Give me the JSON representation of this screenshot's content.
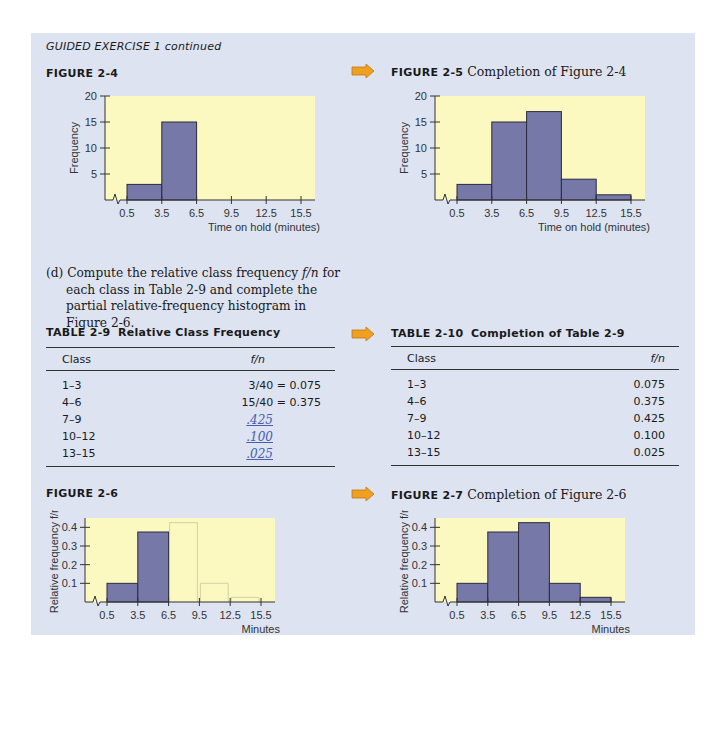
{
  "section_header": "GUIDED EXERCISE 1 continued",
  "figures": {
    "fig_2_4": {
      "label": "FIGURE 2-4",
      "title": ""
    },
    "fig_2_5": {
      "label": "FIGURE 2-5",
      "title": "Completion of Figure 2-4"
    },
    "fig_2_6": {
      "label": "FIGURE 2-6",
      "title": ""
    },
    "fig_2_7": {
      "label": "FIGURE 2-7",
      "title": "Completion of Figure 2-6"
    }
  },
  "paragraph": {
    "prefix": "(d) Compute the relative class frequency ",
    "italic": "f/n",
    "suffix": " for each class in Table 2-9 and complete the partial relative-frequency histogram in Figure 2-6."
  },
  "table_2_9": {
    "label": "TABLE 2-9",
    "title": "Relative Class Frequency",
    "columns": [
      "Class",
      "f/n"
    ],
    "rows": [
      {
        "class": "1–3",
        "value": "3/40 = 0.075",
        "handwritten": false
      },
      {
        "class": "4–6",
        "value": "15/40 = 0.375",
        "handwritten": false
      },
      {
        "class": "7–9",
        "value": ".425",
        "handwritten": true
      },
      {
        "class": "10–12",
        "value": ".100",
        "handwritten": true
      },
      {
        "class": "13–15",
        "value": ".025",
        "handwritten": true
      }
    ]
  },
  "table_2_10": {
    "label": "TABLE 2-10",
    "title": "Completion of Table 2-9",
    "columns": [
      "Class",
      "f/n"
    ],
    "rows": [
      {
        "class": "1–3",
        "value": "0.075"
      },
      {
        "class": "4–6",
        "value": "0.375"
      },
      {
        "class": "7–9",
        "value": "0.425"
      },
      {
        "class": "10–12",
        "value": "0.100"
      },
      {
        "class": "13–15",
        "value": "0.025"
      }
    ]
  },
  "colors": {
    "panel_bg": "#dde3f1",
    "plot_bg": "#fbf8c0",
    "bar_fill": "#7678a8",
    "bar_stroke": "#2a2a40",
    "arrow": "#f0a020"
  },
  "chart_data": [
    {
      "id": "figure-2-4",
      "type": "bar",
      "title": "FIGURE 2-4",
      "xlabel": "Time on hold (minutes)",
      "ylabel": "Frequency",
      "x_ticks": [
        "0.5",
        "3.5",
        "6.5",
        "9.5",
        "12.5",
        "15.5"
      ],
      "y_ticks": [
        "5",
        "10",
        "15",
        "20"
      ],
      "ylim": [
        0,
        20
      ],
      "bins": [
        [
          0.5,
          3.5
        ],
        [
          3.5,
          6.5
        ]
      ],
      "values": [
        3,
        15
      ],
      "ticks_v": [
        5,
        10,
        15,
        20
      ]
    },
    {
      "id": "figure-2-5",
      "type": "bar",
      "title": "FIGURE 2-5 Completion of Figure 2-4",
      "xlabel": "Time on hold (minutes)",
      "ylabel": "Frequency",
      "x_ticks": [
        "0.5",
        "3.5",
        "6.5",
        "9.5",
        "12.5",
        "15.5"
      ],
      "y_ticks": [
        "5",
        "10",
        "15",
        "20"
      ],
      "ylim": [
        0,
        20
      ],
      "bins": [
        [
          0.5,
          3.5
        ],
        [
          3.5,
          6.5
        ],
        [
          6.5,
          9.5
        ],
        [
          9.5,
          12.5
        ],
        [
          12.5,
          15.5
        ]
      ],
      "values": [
        3,
        15,
        17,
        4,
        1
      ],
      "ticks_v": [
        5,
        10,
        15,
        20
      ]
    },
    {
      "id": "figure-2-6",
      "type": "bar",
      "title": "FIGURE 2-6",
      "xlabel": "Minutes",
      "ylabel": "Relative frequency f/n",
      "x_ticks": [
        "0.5",
        "3.5",
        "6.5",
        "9.5",
        "12.5",
        "15.5"
      ],
      "y_ticks": [
        "0.1",
        "0.2",
        "0.3",
        "0.4"
      ],
      "ylim": [
        0,
        0.45
      ],
      "bins": [
        [
          0.5,
          3.5
        ],
        [
          3.5,
          6.5
        ]
      ],
      "values": [
        0.1,
        0.375
      ],
      "ticks_v": [
        0.1,
        0.2,
        0.3,
        0.4
      ],
      "pencil_sketch_values": [
        0.425,
        0.1,
        0.025
      ]
    },
    {
      "id": "figure-2-7",
      "type": "bar",
      "title": "FIGURE 2-7 Completion of Figure 2-6",
      "xlabel": "Minutes",
      "ylabel": "Relative frequency f/n",
      "x_ticks": [
        "0.5",
        "3.5",
        "6.5",
        "9.5",
        "12.5",
        "15.5"
      ],
      "y_ticks": [
        "0.1",
        "0.2",
        "0.3",
        "0.4"
      ],
      "ylim": [
        0,
        0.45
      ],
      "bins": [
        [
          0.5,
          3.5
        ],
        [
          3.5,
          6.5
        ],
        [
          6.5,
          9.5
        ],
        [
          9.5,
          12.5
        ],
        [
          12.5,
          15.5
        ]
      ],
      "values": [
        0.1,
        0.375,
        0.425,
        0.1,
        0.025
      ],
      "ticks_v": [
        0.1,
        0.2,
        0.3,
        0.4
      ]
    }
  ]
}
